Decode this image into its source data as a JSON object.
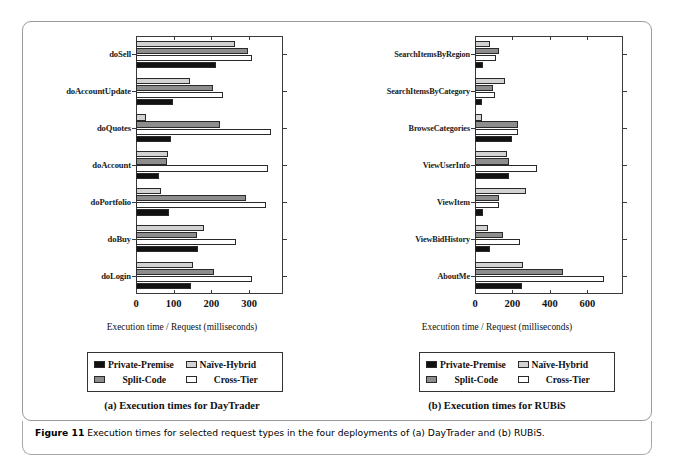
{
  "figure": {
    "caption_label": "Figure 11",
    "caption_text": "Execution times for selected request types in the four deployments of (a) DayTrader and (b) RUBiS."
  },
  "legend": {
    "series": [
      {
        "name": "Private-Premise",
        "color": "#111111"
      },
      {
        "name": "Naïve-Hybrid",
        "color": "#d2d2d2"
      },
      {
        "name": "Split-Code",
        "color": "#8d8d8d"
      },
      {
        "name": "Cross-Tier",
        "color": "#ffffff"
      }
    ]
  },
  "panels": [
    {
      "id": "daytrader",
      "subcaption": "(a) Execution times for DayTrader"
    },
    {
      "id": "rubis",
      "subcaption": "(b) Execution times for RUBiS"
    }
  ],
  "chart_data": [
    {
      "type": "bar",
      "orientation": "horizontal",
      "title": "(a) Execution times for DayTrader",
      "xlabel": "Execution time / Request (milliseconds)",
      "ylabel": "",
      "xlim": [
        0,
        390
      ],
      "xticks": [
        0,
        100,
        200,
        300
      ],
      "grid": false,
      "legend_position": "below",
      "categories": [
        "doSell",
        "doAccountUpdate",
        "doQuotes",
        "doAccount",
        "doPortfolio",
        "doBuy",
        "doLogin"
      ],
      "series": [
        {
          "name": "Private-Premise",
          "values": [
            212,
            97,
            92,
            62,
            88,
            165,
            147
          ]
        },
        {
          "name": "Naïve-Hybrid",
          "values": [
            262,
            142,
            26,
            84,
            66,
            180,
            152
          ]
        },
        {
          "name": "Split-Code",
          "values": [
            296,
            204,
            222,
            82,
            292,
            163,
            208
          ]
        },
        {
          "name": "Cross-Tier",
          "values": [
            307,
            231,
            357,
            351,
            345,
            265,
            307
          ]
        }
      ]
    },
    {
      "type": "bar",
      "orientation": "horizontal",
      "title": "(b) Execution times for RUBiS",
      "xlabel": "Execution time / Request (milliseconds)",
      "ylabel": "",
      "xlim": [
        0,
        790
      ],
      "xticks": [
        0,
        200,
        400,
        600
      ],
      "grid": false,
      "legend_position": "below",
      "categories": [
        "SearchItemsByRegion",
        "SearchItemsByCategory",
        "BrowseCategories",
        "ViewUserInfo",
        "ViewItem",
        "ViewBidHistory",
        "AboutMe"
      ],
      "series": [
        {
          "name": "Private-Premise",
          "values": [
            42,
            40,
            195,
            180,
            45,
            82,
            252
          ]
        },
        {
          "name": "Naïve-Hybrid",
          "values": [
            80,
            162,
            40,
            172,
            272,
            68,
            258
          ]
        },
        {
          "name": "Split-Code",
          "values": [
            128,
            95,
            228,
            182,
            130,
            152,
            470
          ]
        },
        {
          "name": "Cross-Tier",
          "values": [
            112,
            105,
            232,
            330,
            128,
            238,
            690
          ]
        }
      ]
    }
  ]
}
